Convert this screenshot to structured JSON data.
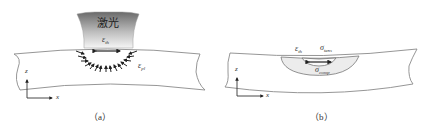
{
  "figure_a": {
    "caption": "（a）",
    "laser_label": "激光",
    "thermal_strain": {
      "symbol": "ε",
      "sub": "th"
    },
    "plastic_strain": {
      "symbol": "ε",
      "sub": "pl"
    },
    "axis_z": "z",
    "axis_x": "x"
  },
  "figure_b": {
    "caption": "（b）",
    "thermal_strain": {
      "symbol": "ε",
      "sub": "th"
    },
    "tensile_stress": {
      "symbol": "σ",
      "sub": "tens"
    },
    "compressive_stress": {
      "symbol": "σ",
      "sub": "comp"
    },
    "axis_z": "z",
    "axis_x": "x"
  },
  "colors": {
    "outline": "#8a8a8a",
    "laser_dark": "#6e6e6e",
    "laser_light": "#f4f4f4",
    "zone_fill": "#eeeeee",
    "arrow": "#222222"
  }
}
